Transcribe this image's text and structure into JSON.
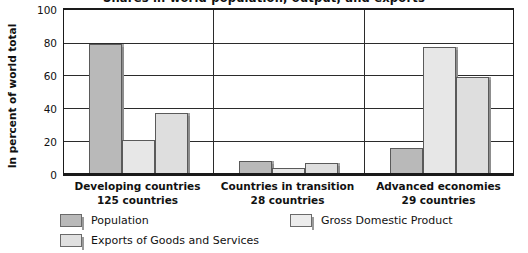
{
  "chart_data": {
    "type": "bar",
    "title": "Shares in world population, output, and exports",
    "xlabel": "",
    "ylabel": "In percent of world total",
    "ylim": [
      0,
      100
    ],
    "yticks": [
      100,
      80,
      60,
      40,
      20,
      0
    ],
    "grid": true,
    "legend_position": "bottom",
    "categories": [
      "Developing countries",
      "Countries in transition",
      "Advanced economies"
    ],
    "category_sublabels": [
      "125 countries",
      "28 countries",
      "29 countries"
    ],
    "series": [
      {
        "name": "Population",
        "values": [
          78,
          7,
          15
        ],
        "color": "#b9b9b9"
      },
      {
        "name": "Gross Domestic Product",
        "values": [
          20,
          3,
          76
        ],
        "color": "#e7e7e7"
      },
      {
        "name": "Exports of Goods and Services",
        "values": [
          36,
          6,
          58
        ],
        "color": "#dedede"
      }
    ]
  },
  "axis": {
    "y_title": "In percent of world total",
    "tick_100": "100",
    "tick_80": "80",
    "tick_60": "60",
    "tick_40": "40",
    "tick_20": "20",
    "tick_0": "0"
  },
  "categories": {
    "g1_name": "Developing countries",
    "g1_sub": "125 countries",
    "g2_name": "Countries in transition",
    "g2_sub": "28 countries",
    "g3_name": "Advanced economies",
    "g3_sub": "29 countries"
  },
  "legend": {
    "population": "Population",
    "gdp": "Gross Domestic Product",
    "exports": "Exports of Goods and Services"
  },
  "title": {
    "text": "Shares in world population, output, and exports"
  }
}
